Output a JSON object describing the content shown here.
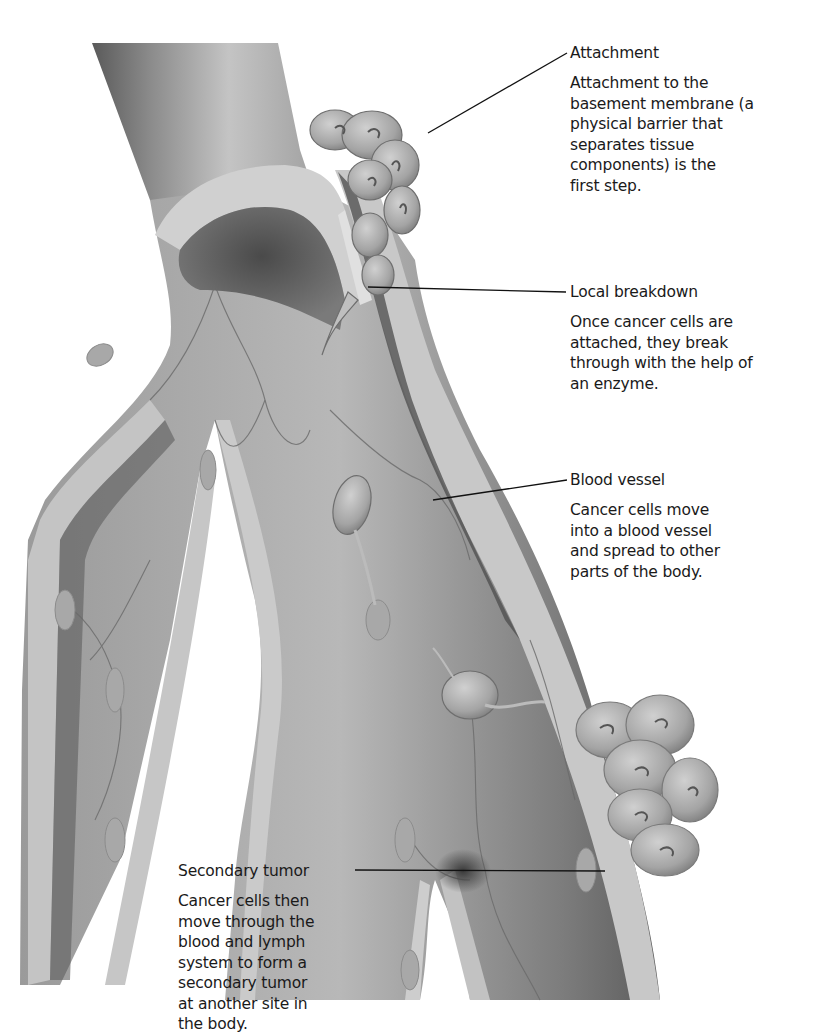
{
  "figure": {
    "colors": {
      "background": "#ffffff",
      "vessel_wall": "#bdbdbd",
      "vessel_dark": "#6e6e6e",
      "cells": "#a9a9a9",
      "text": "#1a1a1a",
      "leader_line": "#111111"
    }
  },
  "labels": [
    {
      "id": "attachment",
      "title": "Attachment",
      "lines": [
        "Attachment to the",
        "basement membrane (a",
        "physical barrier that",
        "separates tissue",
        "components) is the",
        "first step."
      ]
    },
    {
      "id": "local-breakdown",
      "title": "Local breakdown",
      "lines": [
        "Once cancer cells are",
        "attached, they break",
        "through with the help of",
        "an enzyme."
      ]
    },
    {
      "id": "blood-vessel",
      "title": "Blood vessel",
      "lines": [
        "Cancer cells move",
        "into a blood vessel",
        "and spread to other",
        "parts of the body."
      ]
    },
    {
      "id": "secondary-tumor",
      "title": "Secondary tumor",
      "lines": [
        "Cancer cells then",
        "move through the",
        "blood and lymph",
        "system to form a",
        "secondary tumor",
        "at another site in",
        "the body."
      ]
    }
  ]
}
